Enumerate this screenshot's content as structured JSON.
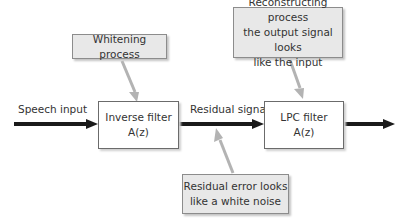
{
  "diagram": {
    "signals": {
      "input_label": "Speech input",
      "residual_label": "Residual signal"
    },
    "blocks": [
      {
        "id": "inverse-filter",
        "line1": "Inverse filter",
        "line2": "A(z)"
      },
      {
        "id": "lpc-filter",
        "line1": "LPC filter",
        "line2": "A(z)"
      }
    ],
    "callouts": [
      {
        "id": "whitening",
        "text": "Whitening process"
      },
      {
        "id": "reconstructing",
        "text": "Reconstructing process\nthe output signal looks\nlike the input"
      },
      {
        "id": "residual-error",
        "text": "Residual error looks\nlike a white noise"
      }
    ],
    "colors": {
      "main_arrow": "#1a1a1a",
      "pointer_arrow": "#b3b3b3",
      "callout_fill": "#e8e8e8",
      "box_border": "#6b6b6b"
    }
  }
}
